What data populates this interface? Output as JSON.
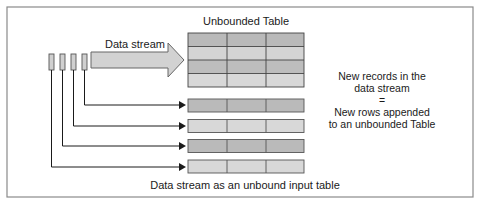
{
  "diagram": {
    "stream_label": "Data stream",
    "table_title": "Unbounded Table",
    "caption": "Data stream as an unbound input table",
    "explanation": {
      "line1": "New records in the",
      "line2": "data stream",
      "equals": "=",
      "line3": "New rows appended",
      "line4": "to an unbounded Table"
    },
    "colors": {
      "border": "#8a8a8a",
      "cell_dark": "#b9b9b9",
      "cell_light": "#d6d6d6",
      "arrow_fill": "#d2d2d2",
      "line": "#1a1a1a"
    },
    "unbounded_table": {
      "rows": 4,
      "columns": 3
    },
    "appended_rows": 4,
    "stream_records": 4
  }
}
